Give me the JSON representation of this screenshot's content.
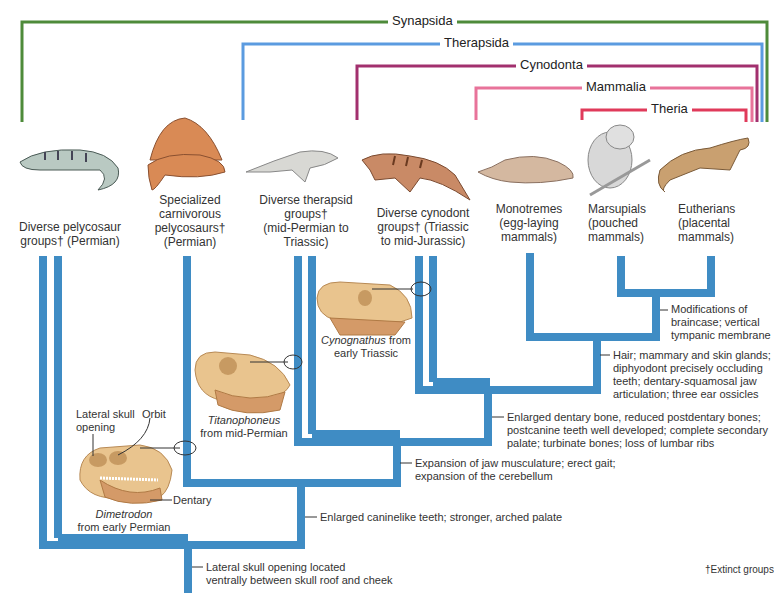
{
  "clades": [
    {
      "name": "Synapsida",
      "color": "#4e8b3a"
    },
    {
      "name": "Therapsida",
      "color": "#5b9be0"
    },
    {
      "name": "Cynodonta",
      "color": "#a2306e"
    },
    {
      "name": "Mammalia",
      "color": "#e8739a"
    },
    {
      "name": "Theria",
      "color": "#e03a5a"
    }
  ],
  "taxa": [
    {
      "line1": "Diverse pelycosaur",
      "line2": "groups† (Permian)",
      "line3": "",
      "line4": "",
      "animal": "pelycosaur-illustration"
    },
    {
      "line1": "Specialized",
      "line2": "carnivorous",
      "line3": "pelycosaurs†",
      "line4": "(Permian)",
      "animal": "dimetrodon-illustration"
    },
    {
      "line1": "Diverse therapsid",
      "line2": "groups†",
      "line3": "(mid-Permian to",
      "line4": "Triassic)",
      "animal": "therapsid-illustration"
    },
    {
      "line1": "Diverse cynodont",
      "line2": "groups† (Triassic",
      "line3": "to mid-Jurassic)",
      "line4": "",
      "animal": "cynodont-illustration"
    },
    {
      "line1": "Monotremes",
      "line2": "(egg-laying",
      "line3": "mammals)",
      "line4": "",
      "animal": "platypus-illustration"
    },
    {
      "line1": "Marsupials",
      "line2": "(pouched",
      "line3": "mammals)",
      "line4": "",
      "animal": "koala-illustration"
    },
    {
      "line1": "Eutherians",
      "line2": "(placental",
      "line3": "mammals)",
      "line4": "",
      "animal": "ferret-illustration"
    }
  ],
  "characters": [
    {
      "line1": "Modifications of",
      "line2": "braincase; vertical",
      "line3": "tympanic membrane",
      "line4": ""
    },
    {
      "line1": "Hair; mammary and skin glands;",
      "line2": "diphyodont precisely occluding",
      "line3": "teeth; dentary-squamosal jaw",
      "line4": "articulation; three ear ossicles"
    },
    {
      "line1": "Enlarged dentary bone, reduced postdentary bones;",
      "line2": "postcanine teeth well developed; complete secondary",
      "line3": "palate; turbinate bones; loss of lumbar ribs",
      "line4": ""
    },
    {
      "line1": "Expansion of jaw musculature; erect gait;",
      "line2": "expansion of the cerebellum",
      "line3": "",
      "line4": ""
    },
    {
      "line1": "Enlarged caninelike teeth; stronger, arched palate",
      "line2": "",
      "line3": "",
      "line4": ""
    },
    {
      "line1": "Lateral skull opening located",
      "line2": "ventrally between skull roof and cheek",
      "line3": "",
      "line4": ""
    }
  ],
  "skulls": [
    {
      "genus": "Dimetrodon",
      "era": "from early Permian",
      "labels": {
        "opening_1": "Lateral skull",
        "opening_2": "opening",
        "orbit": "Orbit",
        "dentary": "Dentary"
      }
    },
    {
      "genus": "Titanophoneus",
      "era": "from mid-Permian"
    },
    {
      "genus": "Cynognathus",
      "era": " from",
      "era2": "early Triassic"
    }
  ],
  "footnote": "†Extinct groups",
  "colors": {
    "trunk": "#3f8cc4",
    "skull": "#e9c48e",
    "skull_jaw": "#d49a68"
  }
}
